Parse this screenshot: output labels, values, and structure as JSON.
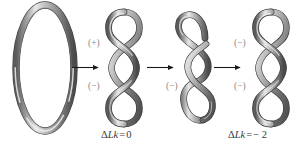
{
  "figure": {
    "background_color": "#ffffff",
    "tube_colors": {
      "highlight": "#f2f2f2",
      "mid": "#9a9a9a",
      "shadow": "#4a4a4a",
      "outline": "#3a3a3a"
    },
    "arrow_color": "#1a1a1a",
    "label_color": "#8a8a8a",
    "caption_color": "#3a3a3a"
  },
  "structures": [
    {
      "id": "relaxed-circular-dna",
      "name": "relaxed circular DNA loop",
      "shape": "ellipse",
      "crossings": 0
    },
    {
      "id": "supercoiled-dna-plus-minus",
      "name": "supercoiled DNA with plus and minus nodes",
      "shape": "three-lobe-plectoneme",
      "crossings": 2,
      "signs": [
        {
          "label": "(+)",
          "position": "top"
        },
        {
          "label": "(−)",
          "position": "bottom"
        }
      ]
    },
    {
      "id": "nicked-dna-minus",
      "name": "nicked open DNA with single minus node",
      "shape": "open-hook-two-lobe",
      "crossings": 1,
      "signs": [
        {
          "label": "(−)",
          "position": "bottom"
        }
      ]
    },
    {
      "id": "supercoiled-dna-minus-minus",
      "name": "supercoiled DNA with two minus nodes",
      "shape": "three-lobe-plectoneme",
      "crossings": 2,
      "signs": [
        {
          "label": "(−)",
          "position": "top"
        },
        {
          "label": "(−)",
          "position": "bottom"
        }
      ]
    }
  ],
  "arrows": [
    {
      "id": "arrow-1",
      "direction": "right",
      "from": "relaxed-circular-dna",
      "to": "supercoiled-dna-plus-minus"
    },
    {
      "id": "arrow-2",
      "direction": "right",
      "from": "supercoiled-dna-plus-minus",
      "to": "nicked-dna-minus"
    },
    {
      "id": "arrow-3",
      "direction": "right",
      "from": "nicked-dna-minus",
      "to": "supercoiled-dna-minus-minus"
    }
  ],
  "sign_labels": {
    "struct2_top": "(+)",
    "struct2_bottom": "(−)",
    "struct3_bottom": "(−)",
    "struct4_top": "(−)",
    "struct4_bottom": "(−)"
  },
  "captions": {
    "left": {
      "symbol": "Δ",
      "variable": "Lk",
      "operator": "=",
      "value": "0",
      "full": "ΔLk = 0"
    },
    "right": {
      "symbol": "Δ",
      "variable": "Lk",
      "operator": "=",
      "value": "− 2",
      "full": "ΔLk = − 2"
    }
  }
}
